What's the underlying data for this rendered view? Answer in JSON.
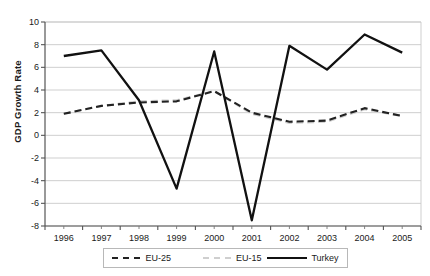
{
  "chart_data": {
    "type": "line",
    "title": "",
    "xlabel": "",
    "ylabel": "GDP Growth Rate",
    "categories": [
      "1996",
      "1997",
      "1998",
      "1999",
      "2000",
      "2001",
      "2002",
      "2003",
      "2004",
      "2005"
    ],
    "x": [
      1996,
      1997,
      1998,
      1999,
      2000,
      2001,
      2002,
      2003,
      2004,
      2005
    ],
    "ylim": [
      -8,
      10
    ],
    "yticks": [
      -8,
      -6,
      -4,
      -2,
      0,
      2,
      4,
      6,
      8,
      10
    ],
    "ytick_labels": [
      "-8",
      "-6",
      "-4",
      "-2",
      "0",
      "2",
      "4",
      "6",
      "8",
      "10"
    ],
    "grid": true,
    "grid_axis": "y",
    "legend_position": "bottom",
    "series": [
      {
        "name": "EU-25",
        "style": "dashed",
        "color": "#222222",
        "values": [
          1.9,
          2.6,
          2.9,
          3.0,
          3.9,
          2.0,
          1.2,
          1.3,
          2.4,
          1.7
        ]
      },
      {
        "name": "EU-15",
        "style": "dashed",
        "color": "#cfcfcf",
        "values": [
          1.9,
          2.6,
          3.0,
          3.1,
          3.9,
          1.9,
          1.1,
          1.2,
          2.3,
          1.7
        ]
      },
      {
        "name": "Turkey",
        "style": "solid",
        "color": "#111111",
        "values": [
          7.0,
          7.5,
          3.1,
          -4.7,
          7.4,
          -7.5,
          7.9,
          5.8,
          8.9,
          7.3
        ]
      }
    ]
  },
  "axis": {
    "y_title": "GDP Growth Rate"
  },
  "legend": {
    "items": [
      {
        "label": "EU-25",
        "marker": "dashed-dark"
      },
      {
        "label": "EU-15",
        "marker": "dashed-light"
      },
      {
        "label": "Turkey",
        "marker": "solid-black"
      }
    ]
  }
}
